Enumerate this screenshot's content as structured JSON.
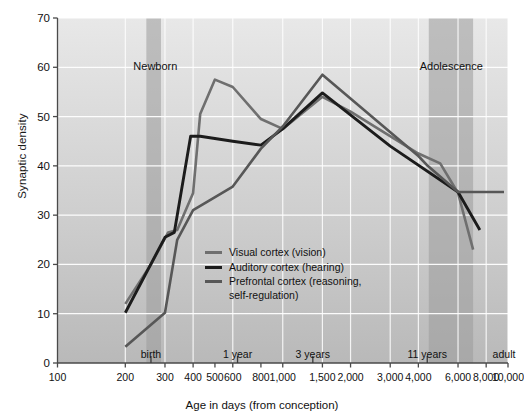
{
  "chart_data": {
    "type": "line",
    "title": "",
    "xlabel": "Age in days (from conception)",
    "ylabel": "Synaptic density",
    "xscale": "log",
    "xlim": [
      100,
      10000
    ],
    "ylim": [
      0,
      70
    ],
    "grid": true,
    "legend_position": "center",
    "y_ticks": [
      0,
      10,
      20,
      30,
      40,
      50,
      60,
      70
    ],
    "x_ticks": [
      100,
      200,
      300,
      400,
      500,
      600,
      800,
      1000,
      1500,
      2000,
      3000,
      4000,
      6000,
      8000,
      10000
    ],
    "x_tick_labels": [
      "100",
      "200",
      "300",
      "400",
      "500",
      "600",
      "800",
      "1,000",
      "1,500",
      "2,000",
      "3,000",
      "4,000",
      "6,000",
      "8,000",
      "10,000"
    ],
    "grid_x": [
      100,
      200,
      300,
      400,
      600,
      1000,
      1500,
      2000,
      3000,
      4000,
      6000,
      8000,
      10000
    ],
    "event_markers": [
      {
        "label": "birth",
        "x": 260
      },
      {
        "label": "1 year",
        "x": 630
      },
      {
        "label": "3 years",
        "x": 1360
      },
      {
        "label": "11 years",
        "x": 4380
      },
      {
        "label": "adult",
        "x": 9600,
        "no_tick": true
      }
    ],
    "bands": [
      {
        "label": "Newborn",
        "x0": 248,
        "x1": 288,
        "label_x": 272,
        "label_y": 60
      },
      {
        "label": "Adolescence",
        "x0": 4450,
        "x1": 7000,
        "label_x": 5600,
        "label_y": 60
      }
    ],
    "series": [
      {
        "name": "Visual cortex (vision)",
        "color": "#6f6f6f",
        "width": 2.6,
        "points": [
          [
            200,
            12.0
          ],
          [
            260,
            20.0
          ],
          [
            310,
            26.5
          ],
          [
            340,
            27.0
          ],
          [
            400,
            34.5
          ],
          [
            430,
            50.5
          ],
          [
            500,
            57.5
          ],
          [
            600,
            56.0
          ],
          [
            800,
            49.5
          ],
          [
            1000,
            47.5
          ],
          [
            1500,
            54.0
          ],
          [
            2000,
            51.0
          ],
          [
            4000,
            42.5
          ],
          [
            5000,
            40.5
          ],
          [
            6000,
            34.5
          ],
          [
            7000,
            23.0
          ]
        ]
      },
      {
        "name": "Auditory cortex (hearing)",
        "color": "#1c1c1c",
        "width": 2.9,
        "points": [
          [
            200,
            10.2
          ],
          [
            300,
            25.5
          ],
          [
            330,
            26.5
          ],
          [
            390,
            46.0
          ],
          [
            430,
            46.0
          ],
          [
            600,
            45.0
          ],
          [
            800,
            44.2
          ],
          [
            1000,
            47.5
          ],
          [
            1500,
            54.8
          ],
          [
            3000,
            44.0
          ],
          [
            6000,
            34.7
          ],
          [
            7500,
            27.0
          ]
        ]
      },
      {
        "name": "Prefrontal cortex (reasoning,\nself-regulation)",
        "color": "#575757",
        "width": 2.6,
        "points": [
          [
            200,
            3.3
          ],
          [
            300,
            10.2
          ],
          [
            340,
            25.0
          ],
          [
            400,
            31.0
          ],
          [
            600,
            35.8
          ],
          [
            800,
            43.5
          ],
          [
            1000,
            48.0
          ],
          [
            1500,
            58.5
          ],
          [
            4000,
            42.0
          ],
          [
            4400,
            40.0
          ],
          [
            6000,
            34.7
          ],
          [
            9600,
            34.7
          ]
        ]
      }
    ]
  },
  "legend": {
    "items": [
      {
        "label": "Visual cortex (vision)",
        "color": "#6f6f6f"
      },
      {
        "label": "Auditory cortex (hearing)",
        "color": "#1c1c1c"
      },
      {
        "label": "Prefrontal cortex (reasoning,\nself-regulation)",
        "color": "#575757"
      }
    ]
  },
  "style": {
    "bg_top": "#e8e8e8",
    "bg_bottom": "#b9b9b9",
    "grid_color": "#ffffff",
    "axis_color": "#4a4a4a",
    "band_color": "#9b9b9b",
    "page_bg": "#ffffff"
  }
}
